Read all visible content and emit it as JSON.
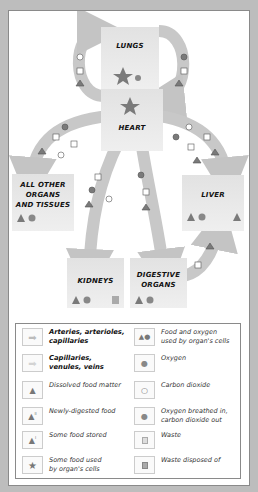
{
  "colors": {
    "panel_bg": "#ffffff",
    "frame_bg": "#bdbdbd",
    "arrow_fill": "#c4c4c4",
    "symbol_fill": "#7a7a7a",
    "organ_bg": "#e6e6e6"
  },
  "organs": {
    "lungs": "LUNGS",
    "heart": "HEART",
    "other": [
      "ALL OTHER",
      "ORGANS",
      "AND TISSUES"
    ],
    "liver": "LIVER",
    "kidneys": "KIDNEYS",
    "digestive": [
      "DIGESTIVE",
      "ORGANS"
    ]
  },
  "legend": {
    "left": [
      {
        "icon": "arrow-dark",
        "text": [
          "Arteries, arterioles,",
          "capillaries"
        ],
        "bold": true
      },
      {
        "icon": "arrow-light",
        "text": [
          "Capillaries,",
          "venules, veins"
        ],
        "bold": true
      },
      {
        "icon": "triangle",
        "text": [
          "Dissolved food matter"
        ]
      },
      {
        "icon": "triangle-ii",
        "text": [
          "Newly-digested food"
        ]
      },
      {
        "icon": "triangle-i",
        "text": [
          "Some food stored"
        ]
      },
      {
        "icon": "star",
        "text": [
          "Some food used",
          "by organ's cells"
        ]
      }
    ],
    "right": [
      {
        "icon": "triangle-circle",
        "text": [
          "Food and oxygen",
          "used by organ's cells"
        ]
      },
      {
        "icon": "circle-filled",
        "text": [
          "Oxygen"
        ]
      },
      {
        "icon": "circle-open",
        "text": [
          "Carbon dioxide"
        ]
      },
      {
        "icon": "circle-dot",
        "text": [
          "Oxygen breathed in,",
          "carbon dioxide out"
        ]
      },
      {
        "icon": "square-light",
        "text": [
          "Waste"
        ]
      },
      {
        "icon": "square-dark",
        "text": [
          "Waste disposed of"
        ]
      }
    ]
  }
}
